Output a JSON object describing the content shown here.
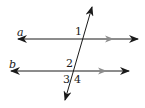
{
  "diagram": {
    "type": "parallel-lines-transversal",
    "colors": {
      "line": "#1a1a1a",
      "parallel_marker": "#8c8c8c",
      "background": "#ffffff"
    },
    "lines": [
      {
        "name": "a",
        "label": "a",
        "y": 39,
        "x1": 18,
        "x2": 138,
        "marker_x": 113
      },
      {
        "name": "b",
        "label": "b",
        "y": 71,
        "x1": 11,
        "x2": 129,
        "marker_x": 106
      }
    ],
    "transversal": {
      "x1": 92,
      "y1": 7,
      "x2": 65,
      "y2": 100
    },
    "angle_labels": [
      {
        "id": "1",
        "text": "1"
      },
      {
        "id": "2",
        "text": "2"
      },
      {
        "id": "3",
        "text": "3"
      },
      {
        "id": "4",
        "text": "4"
      }
    ],
    "slash": "/"
  }
}
